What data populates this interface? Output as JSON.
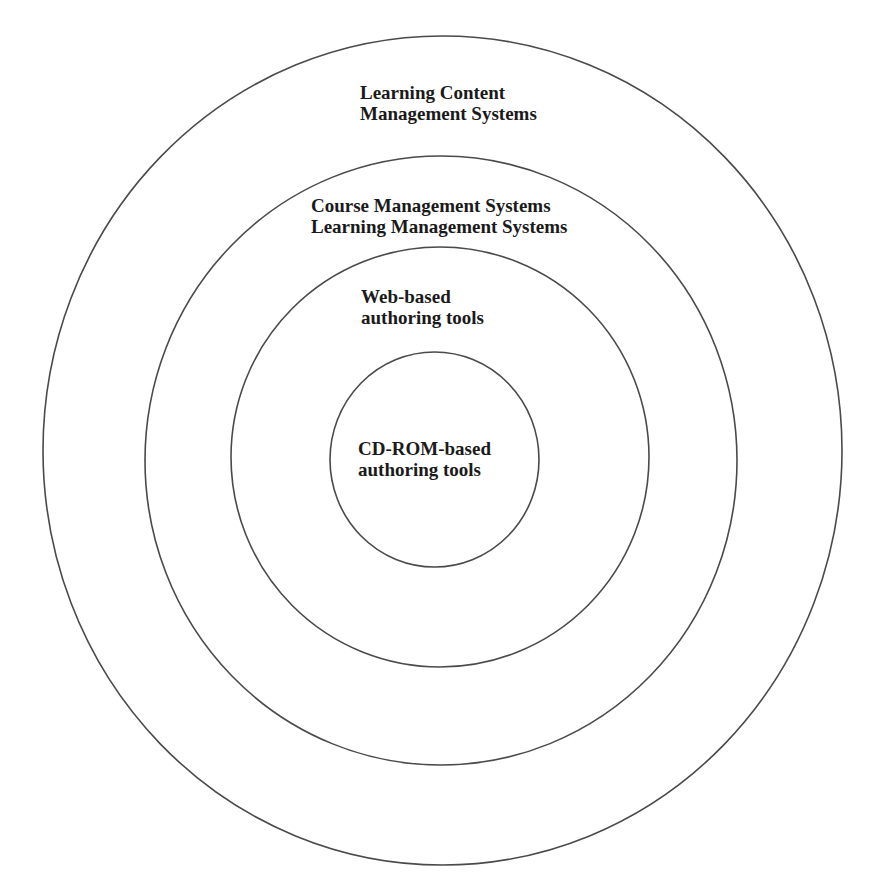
{
  "diagram": {
    "type": "concentric-circles",
    "rings": [
      {
        "id": "outer",
        "level": 1,
        "label_lines": [
          "Learning Content",
          "Management Systems"
        ]
      },
      {
        "id": "second",
        "level": 2,
        "label_lines": [
          "Course Management Systems",
          "Learning Management Systems"
        ]
      },
      {
        "id": "third",
        "level": 3,
        "label_lines": [
          "Web-based",
          "authoring tools"
        ]
      },
      {
        "id": "inner",
        "level": 4,
        "label_lines": [
          "CD-ROM-based",
          "authoring tools"
        ]
      }
    ],
    "colors": {
      "stroke": "#4a4a4a",
      "text": "#1a1a1a",
      "background": "#ffffff"
    }
  }
}
